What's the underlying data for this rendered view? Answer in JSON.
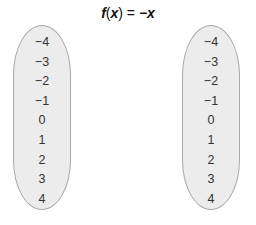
{
  "title": {
    "f": "f",
    "lparen": "(",
    "x": "x",
    "rparen": ")",
    "equals": " = ",
    "rhs": "−x"
  },
  "domain_set": {
    "values": [
      "−4",
      "−3",
      "−2",
      "−1",
      "0",
      "1",
      "2",
      "3",
      "4"
    ]
  },
  "range_set": {
    "values": [
      "−4",
      "−3",
      "−2",
      "−1",
      "0",
      "1",
      "2",
      "3",
      "4"
    ]
  },
  "colors": {
    "oval_fill": "#ececec",
    "oval_border": "#a8a8a8"
  }
}
